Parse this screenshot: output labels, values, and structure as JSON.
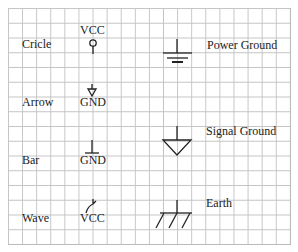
{
  "symbols": [
    {
      "label": "Cricle",
      "net": "VCC",
      "icon": "circle-power-icon"
    },
    {
      "label": "Arrow",
      "net": "GND",
      "icon": "arrow-ground-icon"
    },
    {
      "label": "Bar",
      "net": "GND",
      "icon": "bar-ground-icon"
    },
    {
      "label": "Wave",
      "net": "VCC",
      "icon": "wave-power-icon"
    }
  ],
  "grounds": [
    {
      "label": "Power Ground",
      "icon": "power-ground-icon"
    },
    {
      "label": "Signal Ground",
      "icon": "signal-ground-icon"
    },
    {
      "label": "Earth",
      "icon": "earth-ground-icon"
    }
  ]
}
